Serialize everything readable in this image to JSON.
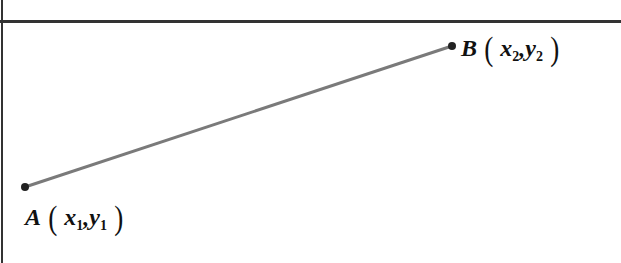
{
  "diagram": {
    "type": "line-segment",
    "points": [
      {
        "name": "A",
        "x_label": "x",
        "x_sub": "1",
        "y_label": "y",
        "y_sub": "1",
        "px": [
          25,
          187
        ]
      },
      {
        "name": "B",
        "x_label": "x",
        "x_sub": "2",
        "y_label": "y",
        "y_sub": "2",
        "px": [
          452,
          46
        ]
      }
    ],
    "segment_color": "#7a7a7a",
    "point_color": "#222222",
    "paren_open": "(",
    "paren_close": ")",
    "comma": ","
  }
}
